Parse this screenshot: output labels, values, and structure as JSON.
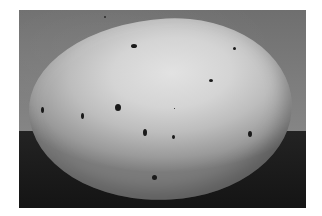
{
  "image": {
    "description": "Black-and-white photograph of a large pale speckled egg resting on a dark surface against a gray backdrop",
    "colors": {
      "page_background": "#ffffff",
      "backdrop": "#7a7a7a",
      "surface": "#1c1c1c",
      "egg_highlight": "#e2e2e2",
      "egg_shadow": "#7c7c7c",
      "speckle": "#1a1a1a"
    },
    "frame": {
      "left": 19,
      "top": 10,
      "width": 287,
      "height": 198
    },
    "horizon_y": 131,
    "egg": {
      "left": 29,
      "top": 19,
      "right": 292,
      "bottom": 199
    },
    "speckles": [
      {
        "x": 134,
        "y": 46,
        "w": 6,
        "h": 4
      },
      {
        "x": 234,
        "y": 48,
        "w": 3,
        "h": 3
      },
      {
        "x": 211,
        "y": 80,
        "w": 4,
        "h": 3
      },
      {
        "x": 42,
        "y": 110,
        "w": 3,
        "h": 6
      },
      {
        "x": 82,
        "y": 116,
        "w": 3,
        "h": 6
      },
      {
        "x": 118,
        "y": 107,
        "w": 6,
        "h": 7
      },
      {
        "x": 174,
        "y": 108,
        "w": 1,
        "h": 1
      },
      {
        "x": 145,
        "y": 132,
        "w": 4,
        "h": 7
      },
      {
        "x": 173,
        "y": 137,
        "w": 3,
        "h": 4
      },
      {
        "x": 250,
        "y": 134,
        "w": 4,
        "h": 6
      },
      {
        "x": 154,
        "y": 177,
        "w": 5,
        "h": 5
      }
    ],
    "dust": [
      {
        "x": 104,
        "y": 16,
        "w": 2,
        "h": 2
      }
    ]
  }
}
